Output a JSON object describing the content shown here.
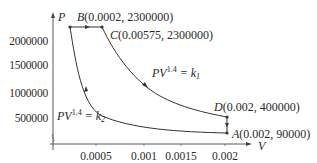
{
  "diagram": {
    "type": "pv-diagram",
    "axes": {
      "y_label": "P",
      "x_label": "V",
      "y_ticks": [
        "2000000",
        "1500000",
        "1000000",
        "500000"
      ],
      "x_ticks": [
        "0.0005",
        "0.001",
        "0.0015",
        "0.002"
      ]
    },
    "points": {
      "B": {
        "name": "B",
        "coords": "(0.0002, 2300000)",
        "V": 0.0002,
        "P": 2300000
      },
      "C": {
        "name": "C",
        "coords": "(0.00575, 2300000)",
        "V": 0.00575,
        "P": 2300000
      },
      "D": {
        "name": "D",
        "coords": "(0.002, 400000)",
        "V": 0.002,
        "P": 400000
      },
      "A": {
        "name": "A",
        "coords": "(0.002, 90000)",
        "V": 0.002,
        "P": 90000
      }
    },
    "curves": {
      "k1": {
        "lhs": "PV",
        "exp": "1.4",
        "eq": " = k",
        "sub": "1"
      },
      "k2": {
        "lhs": "PV",
        "exp": "1.4",
        "eq": " = k",
        "sub": "2"
      }
    },
    "colors": {
      "line": "#3a3a3a",
      "text": "#2a2a2a"
    }
  }
}
